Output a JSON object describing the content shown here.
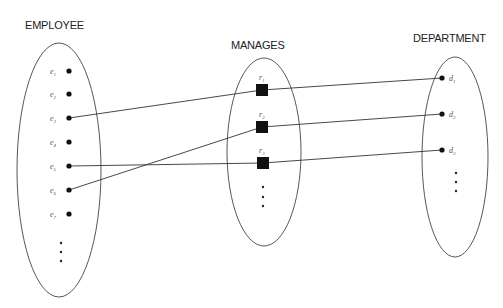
{
  "diagram": {
    "type": "er-relationship-instance",
    "sets": {
      "employee": {
        "title": "EMPLOYEE",
        "elements": [
          {
            "id": "e1",
            "base": "e",
            "sub": "1"
          },
          {
            "id": "e2",
            "base": "e",
            "sub": "2"
          },
          {
            "id": "e3",
            "base": "e",
            "sub": "3"
          },
          {
            "id": "e4",
            "base": "e",
            "sub": "4"
          },
          {
            "id": "e5",
            "base": "e",
            "sub": "5"
          },
          {
            "id": "e6",
            "base": "e",
            "sub": "6"
          },
          {
            "id": "e7",
            "base": "e",
            "sub": "7"
          }
        ],
        "continuation": "..."
      },
      "manages": {
        "title": "MANAGES",
        "elements": [
          {
            "id": "r1",
            "base": "r",
            "sub": "1"
          },
          {
            "id": "r2",
            "base": "r",
            "sub": "2"
          },
          {
            "id": "r3",
            "base": "r",
            "sub": "3"
          }
        ],
        "continuation": "..."
      },
      "department": {
        "title": "DEPARTMENT",
        "elements": [
          {
            "id": "d1",
            "base": "d",
            "sub": "1"
          },
          {
            "id": "d2",
            "base": "d",
            "sub": "2"
          },
          {
            "id": "d3",
            "base": "d",
            "sub": "3"
          }
        ],
        "continuation": "..."
      }
    },
    "relationships": [
      {
        "relationship": "r1",
        "employee": "e3",
        "department": "d1"
      },
      {
        "relationship": "r2",
        "employee": "e6",
        "department": "d2"
      },
      {
        "relationship": "r3",
        "employee": "e5",
        "department": "d3"
      }
    ],
    "colors": {
      "background": "#ffffff",
      "stroke": "#444444",
      "fill": "#111111",
      "text": "#222222"
    }
  }
}
